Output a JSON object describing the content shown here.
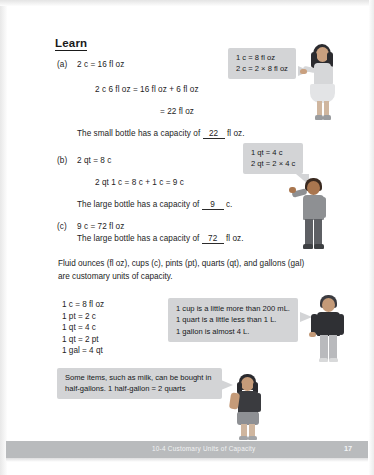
{
  "page": {
    "heading": "Learn",
    "footer_title": "10-4  Customary Units of Capacity",
    "page_number": "17",
    "bg_color": "#ffffff",
    "bubble_color": "#d3d4d6",
    "footer_bar_color": "#b9bbbd"
  },
  "problems": [
    {
      "label": "(a)",
      "line1": "2 c = 16 fl oz",
      "line2": "2 c 6 fl oz = 16 fl oz + 6 fl oz",
      "line3": "= 22 fl oz",
      "answer_prefix": "The small bottle has a capacity of",
      "answer_value": "22",
      "answer_suffix": "fl oz."
    },
    {
      "label": "(b)",
      "line1": "2 qt = 8 c",
      "line2": "2 qt 1 c = 8 c + 1 c = 9 c",
      "answer_prefix": "The large bottle has a capacity of",
      "answer_value": "9",
      "answer_suffix": "c."
    },
    {
      "label": "(c)",
      "line1": "9 c = 72 fl oz",
      "answer_prefix": "The large bottle has a capacity of",
      "answer_value": "72",
      "answer_suffix": "fl oz."
    }
  ],
  "bubbles": {
    "cups": {
      "line1": "1 c = 8 fl oz",
      "line2": "2 c = 2 × 8 fl oz"
    },
    "quarts": {
      "line1": "1 qt = 4 c",
      "line2": "2 qt = 2 × 4 c"
    },
    "metric": {
      "line1": "1 cup is a little more than 200 mL.",
      "line2": "1 quart is a little less than 1 L.",
      "line3": "1 gallon is almost 4 L."
    },
    "milk": {
      "text": "Some items, such as milk, can be bought in half-gallons. 1 half-gallon = 2 quarts"
    }
  },
  "body": {
    "customary_paragraph": "Fluid ounces (fl oz), cups (c), pints (pt), quarts (qt), and gallons (gal) are customary units of capacity.",
    "conversions": [
      "1 c = 8 fl oz",
      "1 pt = 2 c",
      "1 qt = 4 c",
      "1 qt = 2 pt",
      "1 gal = 4 qt"
    ]
  },
  "figures": [
    {
      "name": "girl-pointing-left",
      "hair_color": "#2b2b2f",
      "shirt_color": "#d6d7d9",
      "lower_color": "#e3e4e6",
      "skin_color": "#c9a07f"
    },
    {
      "name": "boy-arm-raised",
      "hair_color": "#3a2a20",
      "shirt_color": "#8e9093",
      "lower_color": "#5e6064",
      "skin_color": "#a9764f"
    },
    {
      "name": "person-dark-top",
      "hair_color": "#3b3b40",
      "shirt_color": "#2f3034",
      "lower_color": "#b9babd",
      "skin_color": "#c49a78"
    },
    {
      "name": "girl-dark-shirt",
      "hair_color": "#2a2a2e",
      "shirt_color": "#3a3b3f",
      "lower_color": "#8e9094",
      "skin_color": "#c59b79"
    }
  ]
}
